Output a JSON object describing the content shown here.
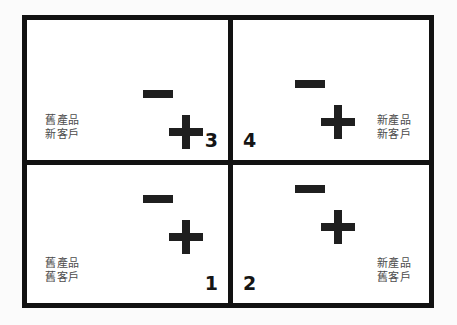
{
  "diagram": {
    "type": "two-by-two-matrix",
    "background_color": "#fbfbfb",
    "border_color": "#121212",
    "label_color": "#4c4c4c",
    "symbol_color": "#1f1f1f",
    "quadrants": [
      {
        "number": "3",
        "position": "top-left",
        "label_line1": "舊產品",
        "label_line2": "新客戶",
        "minus_symbol": "−",
        "plus_symbol": "+"
      },
      {
        "number": "4",
        "position": "top-right",
        "label_line1": "新產品",
        "label_line2": "新客戶",
        "minus_symbol": "−",
        "plus_symbol": "+"
      },
      {
        "number": "1",
        "position": "bottom-left",
        "label_line1": "舊產品",
        "label_line2": "舊客戶",
        "minus_symbol": "−",
        "plus_symbol": "+"
      },
      {
        "number": "2",
        "position": "bottom-right",
        "label_line1": "新產品",
        "label_line2": "舊客戶",
        "minus_symbol": "−",
        "plus_symbol": "+"
      }
    ]
  }
}
